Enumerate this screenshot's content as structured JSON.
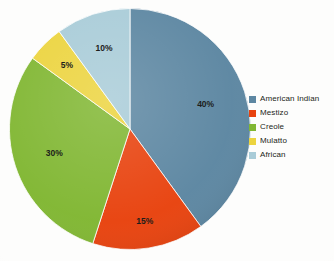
{
  "chart_data": {
    "type": "pie",
    "title": "",
    "subtitle": "",
    "xlabel": "",
    "ylabel": "",
    "grid": false,
    "legend_position": "right",
    "start_angle_deg": 0,
    "direction": "clockwise",
    "categories": [
      "American Indian",
      "Mestizo",
      "Creole",
      "Mulatto",
      "African"
    ],
    "values": [
      40,
      15,
      30,
      5,
      10
    ],
    "value_unit": "%",
    "data_labels": [
      "40%",
      "15%",
      "30%",
      "5%",
      "10%"
    ],
    "colors": [
      "#5d87a2",
      "#e8430f",
      "#81b733",
      "#ecd43f",
      "#a9ccd8"
    ],
    "slices": [
      {
        "label": "American Indian",
        "value": 40,
        "data_label": "40%",
        "color": "#5d87a2"
      },
      {
        "label": "Mestizo",
        "value": 15,
        "data_label": "15%",
        "color": "#e8430f"
      },
      {
        "label": "Creole",
        "value": 30,
        "data_label": "30%",
        "color": "#81b733"
      },
      {
        "label": "Mulatto",
        "value": 5,
        "data_label": "5%",
        "color": "#ecd43f"
      },
      {
        "label": "African",
        "value": 10,
        "data_label": "10%",
        "color": "#a9ccd8"
      }
    ]
  },
  "legend": {
    "items": [
      {
        "label": "American Indian",
        "color": "#5d87a2"
      },
      {
        "label": "Mestizo",
        "color": "#e8430f"
      },
      {
        "label": "Creole",
        "color": "#81b733"
      },
      {
        "label": "Mulatto",
        "color": "#ecd43f"
      },
      {
        "label": "African",
        "color": "#a9ccd8"
      }
    ]
  },
  "labels": {
    "slice_0": "40%",
    "slice_1": "15%",
    "slice_2": "30%",
    "slice_3": "5%",
    "slice_4": "10%"
  }
}
